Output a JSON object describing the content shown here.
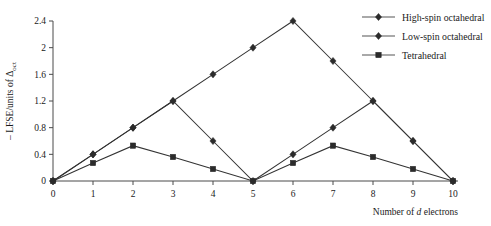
{
  "chart_data": {
    "type": "line",
    "title": "",
    "xlabel": "Number of d electrons",
    "ylabel": "– LFSE/units of Δoct",
    "ylabel_prefix": "– LFSE/units of Δ",
    "ylabel_subscript": "oct",
    "xlabel_pre": "Number of ",
    "xlabel_italic": "d",
    "xlabel_post": " electrons",
    "x": [
      0,
      1,
      2,
      3,
      4,
      5,
      6,
      7,
      8,
      9,
      10
    ],
    "xlim": [
      0,
      10
    ],
    "ylim": [
      0,
      2.4
    ],
    "xticks": [
      "0",
      "1",
      "2",
      "3",
      "4",
      "5",
      "6",
      "7",
      "8",
      "9",
      "10"
    ],
    "yticks": [
      "0",
      "0.4",
      "0.8",
      "1.2",
      "1.6",
      "2",
      "2.4"
    ],
    "ytick_values": [
      0,
      0.4,
      0.8,
      1.2,
      1.6,
      2,
      2.4
    ],
    "grid": false,
    "legend_position": "top-right",
    "series": [
      {
        "name": "High-spin octahedral",
        "marker": "diamond",
        "color": "#2b2b2b",
        "x": [
          0,
          1,
          2,
          3,
          4,
          5,
          6,
          7,
          8,
          9,
          10
        ],
        "values": [
          0,
          0.4,
          0.8,
          1.2,
          0.6,
          0,
          0.4,
          0.8,
          1.2,
          0.6,
          0
        ]
      },
      {
        "name": "Low-spin octahedral",
        "marker": "diamond",
        "color": "#2b2b2b",
        "x": [
          0,
          1,
          2,
          3,
          4,
          5,
          6,
          7,
          8,
          9,
          10
        ],
        "values": [
          0,
          0.4,
          0.8,
          1.2,
          1.6,
          2.0,
          2.4,
          1.8,
          1.2,
          0.6,
          0
        ]
      },
      {
        "name": "Tetrahedral",
        "marker": "square",
        "color": "#2b2b2b",
        "x": [
          0,
          1,
          2,
          3,
          4,
          5,
          6,
          7,
          8,
          9,
          10
        ],
        "values": [
          0,
          0.27,
          0.53,
          0.36,
          0.18,
          0,
          0.27,
          0.53,
          0.36,
          0.18,
          0
        ]
      }
    ],
    "legend": [
      {
        "label": "High-spin octahedral",
        "marker": "diamond"
      },
      {
        "label": "Low-spin octahedral",
        "marker": "diamond"
      },
      {
        "label": "Tetrahedral",
        "marker": "square"
      }
    ]
  }
}
